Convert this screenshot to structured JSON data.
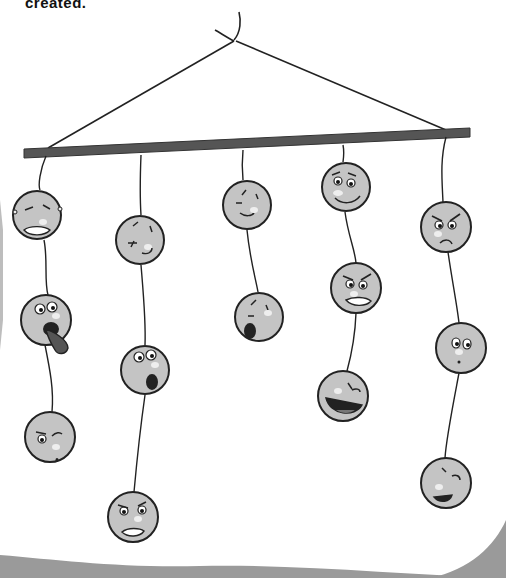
{
  "caption": {
    "text": "created."
  },
  "illustration": {
    "subject": "hanging mobile with emotion faces",
    "rod_color": "#555555",
    "face_fill": "#c4c4c4",
    "outline_color": "#222222",
    "page_curl_color": "#9a9a9a",
    "columns": [
      {
        "name": "column-1",
        "faces": [
          {
            "expression": "crying-grimace",
            "cx": 37,
            "cy": 215
          },
          {
            "expression": "tongue-out",
            "cx": 46,
            "cy": 320
          },
          {
            "expression": "suspicious-winking",
            "cx": 50,
            "cy": 437
          }
        ]
      },
      {
        "name": "column-2",
        "faces": [
          {
            "expression": "sleepy-frown",
            "cx": 140,
            "cy": 240
          },
          {
            "expression": "surprised",
            "cx": 145,
            "cy": 370
          },
          {
            "expression": "angry-grimace",
            "cx": 133,
            "cy": 517
          }
        ]
      },
      {
        "name": "column-3",
        "faces": [
          {
            "expression": "content-smile",
            "cx": 247,
            "cy": 205
          },
          {
            "expression": "yawning",
            "cx": 259,
            "cy": 317
          }
        ]
      },
      {
        "name": "column-4",
        "faces": [
          {
            "expression": "worried-smile",
            "cx": 346,
            "cy": 187
          },
          {
            "expression": "furious",
            "cx": 356,
            "cy": 288
          },
          {
            "expression": "laughing",
            "cx": 343,
            "cy": 396
          }
        ]
      },
      {
        "name": "column-5",
        "faces": [
          {
            "expression": "angry-frown",
            "cx": 446,
            "cy": 227
          },
          {
            "expression": "puzzled",
            "cx": 461,
            "cy": 348
          },
          {
            "expression": "playful-tongue",
            "cx": 446,
            "cy": 483
          }
        ]
      }
    ]
  }
}
